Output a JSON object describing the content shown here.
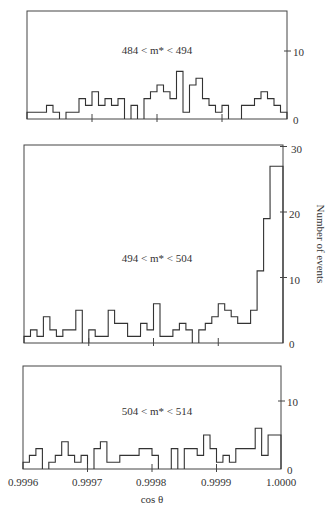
{
  "chart_data": [
    {
      "type": "bar",
      "style": "step-histogram",
      "title": "484 < m* < 494",
      "xlabel": "cos θ",
      "ylabel": "Number of events",
      "xlim": [
        0.9996,
        1.0
      ],
      "ylim": [
        0,
        14
      ],
      "yticks": [
        0,
        10
      ],
      "bin_width": 1e-05,
      "values": [
        1,
        1,
        1,
        2,
        1,
        0,
        1,
        1,
        3,
        2,
        4,
        2,
        3,
        2,
        3,
        0,
        2,
        0,
        3,
        4,
        5,
        4,
        3,
        7,
        1,
        5,
        6,
        3,
        2,
        1,
        2,
        0,
        0,
        2,
        2,
        3,
        4,
        3,
        2,
        1
      ]
    },
    {
      "type": "bar",
      "style": "step-histogram",
      "title": "494 < m* < 504",
      "xlabel": "cos θ",
      "ylabel": "Number of events",
      "xlim": [
        0.9996,
        1.0
      ],
      "ylim": [
        0,
        30
      ],
      "yticks": [
        0,
        10,
        20,
        30
      ],
      "bin_width": 1e-05,
      "values": [
        1,
        2,
        1,
        4,
        2,
        1,
        2,
        2,
        5,
        0,
        2,
        1,
        1,
        5,
        3,
        3,
        1,
        1,
        3,
        2,
        6,
        1,
        1,
        2,
        3,
        2,
        0,
        2,
        3,
        4,
        6,
        5,
        4,
        3,
        3,
        5,
        11,
        19,
        27,
        27
      ]
    },
    {
      "type": "bar",
      "style": "step-histogram",
      "title": "504 < m* < 514",
      "xlabel": "cos θ",
      "ylabel": "Number of events",
      "xlim": [
        0.9996,
        1.0
      ],
      "ylim": [
        0,
        14
      ],
      "xticks": [
        "0.9996",
        "0.9997",
        "0.9998",
        "0.9999",
        "1.0000"
      ],
      "yticks": [
        0,
        10
      ],
      "bin_width": 1e-05,
      "values": [
        1,
        2,
        3,
        0,
        1,
        2,
        4,
        2,
        1,
        2,
        0,
        3,
        4,
        1,
        1,
        2,
        2,
        2,
        3,
        3,
        2,
        0,
        0,
        3,
        0,
        3,
        3,
        2,
        5,
        3,
        1,
        2,
        1,
        3,
        3,
        3,
        6,
        2,
        5,
        5
      ]
    }
  ],
  "labels": {
    "panel1_range": "484 < m* < 494",
    "panel2_range": "494 < m* < 504",
    "panel3_range": "504 < m* < 514",
    "ylabel": "Number of events",
    "xlabel": "cos θ",
    "x_ticks": [
      "0.9996",
      "0.9997",
      "0.9998",
      "0.9999",
      "1.0000"
    ],
    "p1_y": [
      "0",
      "10"
    ],
    "p2_y": [
      "0",
      "10",
      "20",
      "30"
    ],
    "p3_y": [
      "0",
      "10"
    ]
  }
}
